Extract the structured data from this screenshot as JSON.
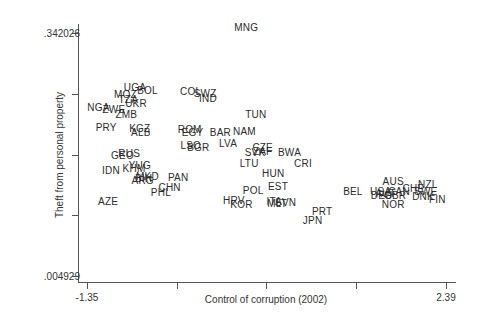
{
  "chart_data": {
    "type": "scatter",
    "title": "",
    "xlabel": "Control of corruption (2002)",
    "ylabel": "Theft from personal property",
    "xlim": [
      -1.35,
      2.39
    ],
    "ylim": [
      0.004929,
      0.342026
    ],
    "xtick_labels": [
      "-1.35",
      "",
      "",
      "",
      "2.39"
    ],
    "ytick_labels": [
      ".342026",
      "",
      "",
      "",
      ".004929"
    ],
    "grid": false,
    "legend": null,
    "marker": "country-code text labels",
    "points": [
      {
        "label": "MNG",
        "x": 0.31,
        "y": 0.349
      },
      {
        "label": "UGA",
        "x": -0.85,
        "y": 0.266
      },
      {
        "label": "BOL",
        "x": -0.72,
        "y": 0.262
      },
      {
        "label": "COL",
        "x": -0.27,
        "y": 0.26
      },
      {
        "label": "SWZ",
        "x": -0.12,
        "y": 0.258
      },
      {
        "label": "IND",
        "x": -0.09,
        "y": 0.251
      },
      {
        "label": "MOZ",
        "x": -0.95,
        "y": 0.256
      },
      {
        "label": "TZA",
        "x": -0.92,
        "y": 0.249
      },
      {
        "label": "UKR",
        "x": -0.84,
        "y": 0.243
      },
      {
        "label": "NGA",
        "x": -1.23,
        "y": 0.238
      },
      {
        "label": "ZWE",
        "x": -1.07,
        "y": 0.235
      },
      {
        "label": "ZMB",
        "x": -0.94,
        "y": 0.228
      },
      {
        "label": "TUN",
        "x": 0.41,
        "y": 0.228
      },
      {
        "label": "PRY",
        "x": -1.15,
        "y": 0.211
      },
      {
        "label": "KGZ",
        "x": -0.8,
        "y": 0.209
      },
      {
        "label": "ALB",
        "x": -0.79,
        "y": 0.204
      },
      {
        "label": "ROM",
        "x": -0.28,
        "y": 0.207
      },
      {
        "label": "EGY",
        "x": -0.25,
        "y": 0.203
      },
      {
        "label": "BAR",
        "x": 0.04,
        "y": 0.204
      },
      {
        "label": "NAM",
        "x": 0.29,
        "y": 0.205
      },
      {
        "label": "LSO",
        "x": -0.27,
        "y": 0.186
      },
      {
        "label": "BGR",
        "x": -0.19,
        "y": 0.183
      },
      {
        "label": "LVA",
        "x": 0.12,
        "y": 0.188
      },
      {
        "label": "CZE",
        "x": 0.48,
        "y": 0.183
      },
      {
        "label": "ZAF",
        "x": 0.48,
        "y": 0.177
      },
      {
        "label": "SVK",
        "x": 0.4,
        "y": 0.175
      },
      {
        "label": "BWA",
        "x": 0.76,
        "y": 0.176
      },
      {
        "label": "RUS",
        "x": -0.91,
        "y": 0.174
      },
      {
        "label": "GEO",
        "x": -0.98,
        "y": 0.171
      },
      {
        "label": "LTU",
        "x": 0.34,
        "y": 0.16
      },
      {
        "label": "CRI",
        "x": 0.9,
        "y": 0.16
      },
      {
        "label": "YUG",
        "x": -0.8,
        "y": 0.157
      },
      {
        "label": "KHM",
        "x": -0.86,
        "y": 0.154
      },
      {
        "label": "IDN",
        "x": -1.1,
        "y": 0.15
      },
      {
        "label": "MKD",
        "x": -0.72,
        "y": 0.142
      },
      {
        "label": "BIH",
        "x": -0.76,
        "y": 0.139
      },
      {
        "label": "ARG",
        "x": -0.77,
        "y": 0.137
      },
      {
        "label": "PAN",
        "x": -0.4,
        "y": 0.141
      },
      {
        "label": "HUN",
        "x": 0.59,
        "y": 0.146
      },
      {
        "label": "CHN",
        "x": -0.49,
        "y": 0.127
      },
      {
        "label": "PHL",
        "x": -0.58,
        "y": 0.12
      },
      {
        "label": "EST",
        "x": 0.64,
        "y": 0.128
      },
      {
        "label": "POL",
        "x": 0.38,
        "y": 0.123
      },
      {
        "label": "BEL",
        "x": 1.42,
        "y": 0.121
      },
      {
        "label": "AUS",
        "x": 1.84,
        "y": 0.135
      },
      {
        "label": "NZL",
        "x": 2.2,
        "y": 0.131
      },
      {
        "label": "CHE",
        "x": 2.05,
        "y": 0.126
      },
      {
        "label": "USA",
        "x": 1.71,
        "y": 0.122
      },
      {
        "label": "CAN",
        "x": 1.9,
        "y": 0.122
      },
      {
        "label": "SWE",
        "x": 2.18,
        "y": 0.122
      },
      {
        "label": "AUT",
        "x": 1.76,
        "y": 0.119
      },
      {
        "label": "DEU",
        "x": 1.72,
        "y": 0.116
      },
      {
        "label": "GBR",
        "x": 1.86,
        "y": 0.116
      },
      {
        "label": "DNK",
        "x": 2.15,
        "y": 0.115
      },
      {
        "label": "FIN",
        "x": 2.3,
        "y": 0.111
      },
      {
        "label": "AZE",
        "x": -1.13,
        "y": 0.108
      },
      {
        "label": "HRV",
        "x": 0.18,
        "y": 0.109
      },
      {
        "label": "KOR",
        "x": 0.26,
        "y": 0.104
      },
      {
        "label": "ITA",
        "x": 0.6,
        "y": 0.108
      },
      {
        "label": "MLT",
        "x": 0.63,
        "y": 0.105
      },
      {
        "label": "SVN",
        "x": 0.72,
        "y": 0.106
      },
      {
        "label": "NOR",
        "x": 1.84,
        "y": 0.103
      },
      {
        "label": "PRT",
        "x": 1.1,
        "y": 0.094
      },
      {
        "label": "JPN",
        "x": 1.0,
        "y": 0.081
      }
    ]
  }
}
